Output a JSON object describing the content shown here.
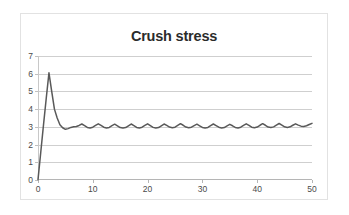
{
  "chart_data": {
    "type": "line",
    "title": "Crush stress",
    "xlabel": "",
    "ylabel": "",
    "xlim": [
      0,
      50
    ],
    "ylim": [
      0,
      7
    ],
    "grid": true,
    "legend": false,
    "series_color": "#595959",
    "gridline_color": "#cfcfcf",
    "axis_color": "#b5b5b5",
    "tick_label_color": "#4a4a4a",
    "title_color": "#2b2b2b",
    "xticks": [
      0,
      10,
      20,
      30,
      40,
      50
    ],
    "yticks": [
      0,
      1,
      2,
      3,
      4,
      5,
      6,
      7
    ],
    "series": [
      {
        "name": "Crush stress",
        "x": [
          0,
          0.5,
          1,
          1.5,
          2,
          2.5,
          3,
          3.5,
          4,
          4.5,
          5,
          5.5,
          6,
          6.5,
          7,
          7.5,
          8,
          8.5,
          9,
          9.5,
          10,
          10.5,
          11,
          11.5,
          12,
          12.5,
          13,
          13.5,
          14,
          14.5,
          15,
          15.5,
          16,
          16.5,
          17,
          17.5,
          18,
          18.5,
          19,
          19.5,
          20,
          20.5,
          21,
          21.5,
          22,
          22.5,
          23,
          23.5,
          24,
          24.5,
          25,
          25.5,
          26,
          26.5,
          27,
          27.5,
          28,
          28.5,
          29,
          29.5,
          30,
          30.5,
          31,
          31.5,
          32,
          32.5,
          33,
          33.5,
          34,
          34.5,
          35,
          35.5,
          36,
          36.5,
          37,
          37.5,
          38,
          38.5,
          39,
          39.5,
          40,
          40.5,
          41,
          41.5,
          42,
          42.5,
          43,
          43.5,
          44,
          44.5,
          45,
          45.5,
          46,
          46.5,
          47,
          47.5,
          48,
          48.5,
          49,
          49.5,
          50
        ],
        "y": [
          0.02,
          1.55,
          3.1,
          4.6,
          6.05,
          5.0,
          4.0,
          3.5,
          3.12,
          2.95,
          2.86,
          2.9,
          2.97,
          3.0,
          3.02,
          3.08,
          3.16,
          3.07,
          2.97,
          2.94,
          2.98,
          3.08,
          3.17,
          3.08,
          2.98,
          2.94,
          2.97,
          3.07,
          3.15,
          3.06,
          2.96,
          2.93,
          2.96,
          3.06,
          3.16,
          3.07,
          2.97,
          2.94,
          2.98,
          3.08,
          3.17,
          3.07,
          2.97,
          2.93,
          2.96,
          3.06,
          3.16,
          3.08,
          2.99,
          2.95,
          2.98,
          3.08,
          3.18,
          3.09,
          2.99,
          2.95,
          2.98,
          3.07,
          3.15,
          3.06,
          2.97,
          2.94,
          2.97,
          3.07,
          3.16,
          3.07,
          2.98,
          2.94,
          2.96,
          3.05,
          3.14,
          3.06,
          2.97,
          2.94,
          2.98,
          3.08,
          3.17,
          3.08,
          2.98,
          2.95,
          2.99,
          3.09,
          3.18,
          3.09,
          2.99,
          2.96,
          3.0,
          3.1,
          3.19,
          3.1,
          3.0,
          2.97,
          3.0,
          3.09,
          3.17,
          3.1,
          3.04,
          3.02,
          3.06,
          3.13,
          3.2
        ]
      }
    ]
  }
}
